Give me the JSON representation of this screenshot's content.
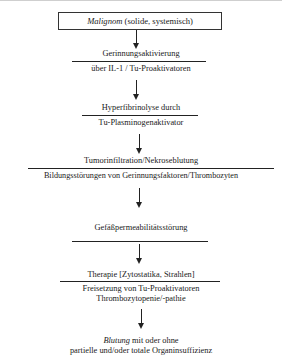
{
  "diagram": {
    "title_box": {
      "italic": "Malignom",
      "rest": " (solide, systemisch)"
    },
    "steps": [
      {
        "above": "Gerinnungsaktivierung",
        "below": "über IL-1 / Tu-Proaktivatoren"
      },
      {
        "above": "Hyperfibrinolyse durch",
        "below": "Tu-Plasminogenaktivator"
      },
      {
        "above": "Tumorinfiltration/Nekroseblutung",
        "below": "Bildungsstörungen von Gerinnungsfaktoren/Thrombozyten"
      },
      {
        "above": "Gefäßpermeabilitätsstörung",
        "below": ""
      },
      {
        "above": "Therapie [Zytostatika, Strahlen]",
        "below": "Freisetzung von Tu-Proaktivatoren",
        "below2": "Thrombozytopenie/-pathie"
      }
    ],
    "outcome": {
      "italic": "Blutung",
      "rest": " mit oder ohne",
      "line2": "partielle und/oder totale Organinsuffizienz"
    }
  }
}
